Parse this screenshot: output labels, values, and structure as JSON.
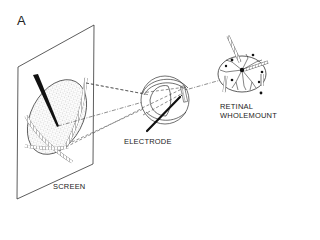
{
  "figure": {
    "panel_label": "A",
    "labels": {
      "screen": "SCREEN",
      "electrode": "ELECTRODE",
      "retina_line1": "RETINAL",
      "retina_line2": "WHOLEMOUNT"
    },
    "colors": {
      "ink": "#222222",
      "stipple": "#9a9a9a",
      "background": "#ffffff"
    }
  }
}
